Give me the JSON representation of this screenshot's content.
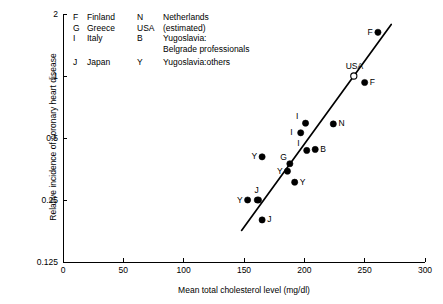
{
  "chart_data": {
    "type": "scatter",
    "title": "",
    "xlabel": "Mean total cholesterol level (mg/dl)",
    "ylabel": "Relative incidence of coronary heart disease",
    "xlim": [
      0,
      300
    ],
    "ylim": [
      0.125,
      2
    ],
    "yscale": "log",
    "xticks": [
      0,
      50,
      100,
      150,
      200,
      250,
      300
    ],
    "xticklabels": [
      "0",
      "50",
      "100",
      "150",
      "200",
      "250",
      "300"
    ],
    "yticks": [
      0.125,
      0.25,
      0.5,
      1,
      2
    ],
    "yticklabels": [
      "0.125",
      "0.25",
      "0.5",
      "1",
      "2"
    ],
    "grid": false,
    "legend_position": "upper-left-inside",
    "points": [
      {
        "label": "Y",
        "x": 153,
        "y": 0.25,
        "filled": true,
        "label_pos": "left"
      },
      {
        "label": "Y",
        "x": 162,
        "y": 0.25,
        "filled": true,
        "label_pos": "none"
      },
      {
        "label": "J",
        "x": 161,
        "y": 0.25,
        "filled": true,
        "label_pos": "above"
      },
      {
        "label": "J",
        "x": 165,
        "y": 0.2,
        "filled": true,
        "label_pos": "right"
      },
      {
        "label": "Y",
        "x": 165,
        "y": 0.405,
        "filled": true,
        "label_pos": "left"
      },
      {
        "label": "Y",
        "x": 186,
        "y": 0.345,
        "filled": true,
        "label_pos": "left"
      },
      {
        "label": "Y",
        "x": 192,
        "y": 0.305,
        "filled": true,
        "label_pos": "right"
      },
      {
        "label": "G",
        "x": 188,
        "y": 0.375,
        "filled": true,
        "label_pos": "upleft"
      },
      {
        "label": "I",
        "x": 197,
        "y": 0.53,
        "filled": true,
        "label_pos": "left"
      },
      {
        "label": "I",
        "x": 201,
        "y": 0.59,
        "filled": true,
        "label_pos": "upleft"
      },
      {
        "label": "I",
        "x": 202,
        "y": 0.435,
        "filled": true,
        "label_pos": "upleft"
      },
      {
        "label": "B",
        "x": 209,
        "y": 0.44,
        "filled": true,
        "label_pos": "right"
      },
      {
        "label": "N",
        "x": 224,
        "y": 0.585,
        "filled": true,
        "label_pos": "right"
      },
      {
        "label": "USA",
        "x": 241,
        "y": 1.0,
        "filled": false,
        "label_pos": "above"
      },
      {
        "label": "F",
        "x": 250,
        "y": 0.93,
        "filled": true,
        "label_pos": "right"
      },
      {
        "label": "F",
        "x": 261,
        "y": 1.63,
        "filled": true,
        "label_pos": "left"
      }
    ],
    "trendline": {
      "x0": 148,
      "y0": 0.178,
      "x1": 272,
      "y1": 1.78
    }
  },
  "legend": {
    "rows": [
      {
        "key1": "F",
        "name1": "Finland",
        "key2": "N",
        "name2": "Netherlands"
      },
      {
        "key1": "G",
        "name1": "Greece",
        "key2": "USA",
        "name2": "(estimated)"
      },
      {
        "key1": "I",
        "name1": "Italy",
        "key2": "B",
        "name2": "Yugoslavia:"
      },
      {
        "key1": "",
        "name1": "",
        "key2": "",
        "name2": "Belgrade professionals"
      },
      {
        "key1": "J",
        "name1": "Japan",
        "key2": "Y",
        "name2": "Yugoslavia:others"
      }
    ]
  },
  "colors": {
    "axis": "#000000",
    "marker": "#000000",
    "line": "#000000",
    "background": "#ffffff"
  }
}
